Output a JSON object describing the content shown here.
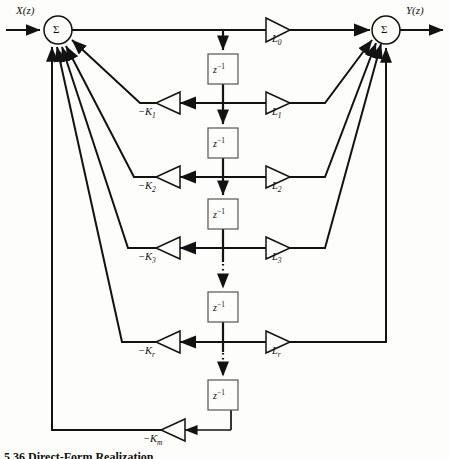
{
  "figure": {
    "type": "signal-flow-diagram",
    "name": "lattice-ladder-filter",
    "input_label": "X(z)",
    "output_label": "Y(z)",
    "summer_symbol": "Σ",
    "delay_block_label_base": "z",
    "delay_block_label_exp": "−1",
    "caption": "5.36    Direct-Form Realization"
  },
  "summers": [
    {
      "id": "left-summer",
      "label": "Σ",
      "cx": 58,
      "cy": 30,
      "r": 14
    },
    {
      "id": "right-summer",
      "label": "Σ",
      "cx": 386,
      "cy": 30,
      "r": 14
    }
  ],
  "delays": [
    {
      "id": "delay-1",
      "x": 208,
      "y": 54,
      "w": 30,
      "h": 30
    },
    {
      "id": "delay-2",
      "x": 208,
      "y": 128,
      "w": 30,
      "h": 30
    },
    {
      "id": "delay-3",
      "x": 208,
      "y": 199,
      "w": 30,
      "h": 30
    },
    {
      "id": "delay-4",
      "x": 208,
      "y": 292,
      "w": 30,
      "h": 30
    },
    {
      "id": "delay-5",
      "x": 208,
      "y": 380,
      "w": 30,
      "h": 30
    }
  ],
  "feedforward_gains": [
    {
      "id": "gain-L0",
      "base": "L",
      "sub": "0",
      "label": "L0",
      "tip_x": 290,
      "cy": 30
    },
    {
      "id": "gain-L1",
      "base": "L",
      "sub": "1",
      "label": "L1",
      "tip_x": 290,
      "cy": 103
    },
    {
      "id": "gain-L2",
      "base": "L",
      "sub": "2",
      "label": "L2",
      "tip_x": 290,
      "cy": 177
    },
    {
      "id": "gain-L3",
      "base": "L",
      "sub": "3",
      "label": "L3",
      "tip_x": 290,
      "cy": 248
    },
    {
      "id": "gain-Lr",
      "base": "L",
      "sub": "r",
      "label": "Lr",
      "tip_x": 290,
      "cy": 342
    }
  ],
  "feedback_gains": [
    {
      "id": "gain-K1",
      "base": "−K",
      "sub": "1",
      "label": "−K1",
      "cy": 103
    },
    {
      "id": "gain-K2",
      "base": "−K",
      "sub": "2",
      "label": "−K2",
      "cy": 177
    },
    {
      "id": "gain-K3",
      "base": "−K",
      "sub": "3",
      "label": "−K3",
      "cy": 248
    },
    {
      "id": "gain-Kr",
      "base": "−K",
      "sub": "r",
      "label": "−Kr",
      "cy": 342
    },
    {
      "id": "gain-Km",
      "base": "−K",
      "sub": "m",
      "label": "−Km",
      "cy": 430
    }
  ],
  "ellipses": [
    {
      "id": "ellipsis-upper",
      "x": 223,
      "y_from": 262,
      "y_to": 288
    },
    {
      "id": "ellipsis-lower",
      "x": 223,
      "y_from": 352,
      "y_to": 376
    }
  ],
  "colors": {
    "line": "#121212",
    "background": "#fdfdfb",
    "text": "#111111",
    "delay_border": "#555555"
  }
}
